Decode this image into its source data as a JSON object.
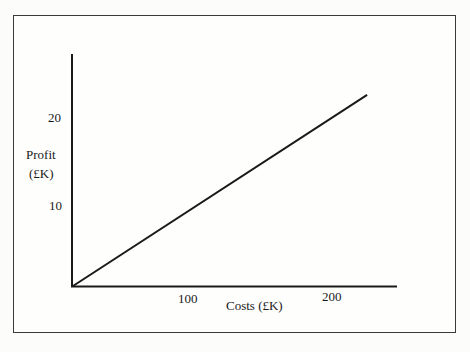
{
  "chart_data": {
    "type": "line",
    "title": "",
    "xlabel": "Costs (£K)",
    "ylabel": "Profit (£K)",
    "ylabel_lines": [
      "Profit",
      "(£K)"
    ],
    "x_ticks": [
      100,
      200
    ],
    "y_ticks": [
      10,
      20
    ],
    "xlim": [
      0,
      245
    ],
    "ylim": [
      0,
      27
    ],
    "grid": false,
    "legend": null,
    "series": [
      {
        "name": "Profit vs Costs",
        "x": [
          0,
          224
        ],
        "y": [
          0,
          22.3
        ],
        "color": "#1a1a1a"
      }
    ]
  },
  "labels": {
    "x_tick_100": "100",
    "x_tick_200": "200",
    "y_tick_10": "10",
    "y_tick_20": "20",
    "x_axis_title": "Costs (£K)",
    "y_axis_title_line1": "Profit",
    "y_axis_title_line2": "(£K)"
  },
  "colors": {
    "axis": "#1a1a1a",
    "line": "#1a1a1a",
    "frame": "#3a3a3a",
    "background": "#fefefd"
  }
}
